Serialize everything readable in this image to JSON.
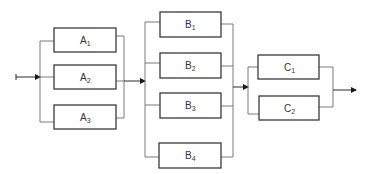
{
  "diagram": {
    "type": "series-parallel reliability block diagram",
    "colors": {
      "box_stroke": "#3a3a3a",
      "wire": "#7a7a7a",
      "arrow": "#2a2a2a",
      "background": "#ffffff"
    },
    "stages": [
      {
        "name": "A",
        "blocks": [
          {
            "letter": "A",
            "sub": "1"
          },
          {
            "letter": "A",
            "sub": "2"
          },
          {
            "letter": "A",
            "sub": "3"
          }
        ]
      },
      {
        "name": "B",
        "blocks": [
          {
            "letter": "B",
            "sub": "1"
          },
          {
            "letter": "B",
            "sub": "2"
          },
          {
            "letter": "B",
            "sub": "3"
          },
          {
            "letter": "B",
            "sub": "4"
          }
        ]
      },
      {
        "name": "C",
        "blocks": [
          {
            "letter": "C",
            "sub": "1"
          },
          {
            "letter": "C",
            "sub": "2"
          }
        ]
      }
    ]
  }
}
